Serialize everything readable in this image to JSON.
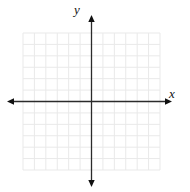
{
  "figure": {
    "background": "#ffffff",
    "axis_color": "#2b2b2b",
    "arrow_color": "#111111",
    "grid_color": "#e9e9e9",
    "label_color": "#111111",
    "x_label": "x",
    "y_label": "y"
  },
  "chart_data": {
    "type": "scatter",
    "title": "",
    "xlabel": "x",
    "ylabel": "y",
    "xlim": [
      -6,
      6
    ],
    "ylim": [
      -6,
      6
    ],
    "grid": true,
    "grid_cells_x": 12,
    "grid_cells_y": 12,
    "legend": "none",
    "series": []
  }
}
